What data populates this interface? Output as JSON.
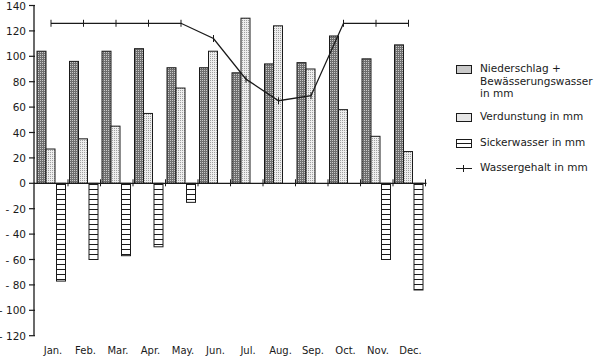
{
  "caption_partial": "Wasserhaushalt  ·  Niederschlag und Bewässerung",
  "chart_data": {
    "type": "bar",
    "title": "",
    "xlabel": "",
    "ylabel": "",
    "ylim": [
      -120,
      140
    ],
    "yticks": [
      140,
      120,
      100,
      80,
      60,
      40,
      20,
      0,
      -20,
      -40,
      -60,
      -80,
      -100,
      -120
    ],
    "ytick_labels": [
      "140",
      "120",
      "100",
      "80",
      "60",
      "40",
      "20",
      "0",
      "- 20",
      "- 40",
      "- 60",
      "- 80",
      "- 100",
      "- 120"
    ],
    "categories": [
      "Jan.",
      "Feb.",
      "Mar.",
      "Apr.",
      "May.",
      "Jun.",
      "Jul.",
      "Aug.",
      "Sep.",
      "Oct.",
      "Nov.",
      "Dec."
    ],
    "grid": false,
    "legend_position": "right",
    "series": [
      {
        "name": "Niederschlag + Bewässerungswasser in mm",
        "type": "bar",
        "pattern": "dark-stipple",
        "values": [
          104,
          96,
          104,
          106,
          91,
          91,
          87,
          94,
          95,
          116,
          98,
          109
        ]
      },
      {
        "name": "Verdunstung in mm",
        "type": "bar",
        "pattern": "light-stipple",
        "values": [
          27,
          35,
          45,
          55,
          75,
          104,
          130,
          124,
          90,
          58,
          37,
          25
        ]
      },
      {
        "name": "Sickerwasser in mm",
        "type": "bar",
        "pattern": "horizontal-hatch",
        "values": [
          -77,
          -60,
          -57,
          -50,
          -15,
          0,
          0,
          0,
          0,
          0,
          -60,
          -84
        ]
      },
      {
        "name": "Wassergehalt in mm",
        "type": "line",
        "marker": "tick",
        "values": [
          126,
          126,
          126,
          126,
          126,
          114,
          82,
          65,
          69,
          126,
          126,
          126
        ]
      }
    ]
  },
  "legend": {
    "items": [
      {
        "label": "Niederschlag + Bewässerungswasser in mm",
        "icon": "dark-stipple-swatch"
      },
      {
        "label": "Verdunstung in mm",
        "icon": "light-stipple-swatch"
      },
      {
        "label": "Sickerwasser in mm",
        "icon": "hatched-swatch"
      },
      {
        "label": "Wassergehalt in mm",
        "icon": "line-with-tick-marker"
      }
    ]
  },
  "colors": {
    "ink": "#1a1a1a",
    "precip_fill": "#7a7a7a",
    "evap_fill": "#e6e6e6",
    "sicker_fill": "#ffffff"
  }
}
